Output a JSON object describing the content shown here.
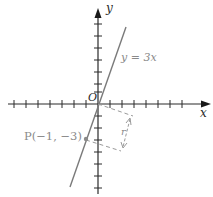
{
  "diagram": {
    "axes": {
      "x_label": "x",
      "y_label": "y",
      "origin_label": "O",
      "tick_spacing_px": 12,
      "x_ticks_left": 7,
      "x_ticks_right": 7,
      "y_ticks_up": 7,
      "y_ticks_down": 7
    },
    "line": {
      "equation_label": "y = 3x",
      "color": "#8a8a8a"
    },
    "point": {
      "label": "P(−1, −3)",
      "x": -1,
      "y": -3,
      "color": "#8a8a8a"
    },
    "distance": {
      "label": "r",
      "style": "dashed perpendicular with double arrow"
    },
    "colors": {
      "axis": "#2a2a2a",
      "line": "#8a8a8a",
      "dashed": "#9a9a9a",
      "label": "#8a8a8a"
    }
  }
}
